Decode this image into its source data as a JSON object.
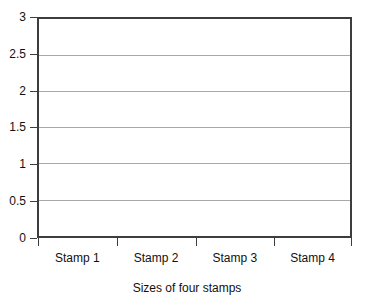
{
  "chart_data": {
    "type": "bar",
    "title": "",
    "xlabel": "Sizes of four stamps",
    "ylabel": "",
    "categories": [
      "Stamp 1",
      "Stamp 2",
      "Stamp 3",
      "Stamp 4"
    ],
    "values": [
      0,
      0,
      0,
      0
    ],
    "series": [
      {
        "name": "Sizes of four stamps",
        "values": [
          0,
          0,
          0,
          0
        ]
      }
    ],
    "ylim": [
      0,
      3
    ],
    "ytick_step": 0.5,
    "yticks": [
      "0",
      "0.5",
      "1",
      "1.5",
      "2",
      "2.5",
      "3"
    ],
    "ytick_values": [
      0,
      0.5,
      1,
      1.5,
      2,
      2.5,
      3
    ],
    "xlim_categories": 4,
    "grid": {
      "horizontal": true,
      "vertical": false,
      "color": "#a8a8a8"
    },
    "legend": {
      "visible": false,
      "position": "none",
      "entries": []
    },
    "annotations": [],
    "colors": {
      "background": "#ffffff",
      "axis": "#3d3d3d",
      "gridline": "#a8a8a8",
      "text": "#111111"
    }
  },
  "axes": {
    "y_tick_labels": [
      "3",
      "2.5",
      "2",
      "1.5",
      "1",
      "0.5",
      "0"
    ],
    "x_tick_labels": [
      "Stamp 1",
      "Stamp 2",
      "Stamp 3",
      "Stamp 4"
    ],
    "x_axis_title": "Sizes of four stamps"
  }
}
